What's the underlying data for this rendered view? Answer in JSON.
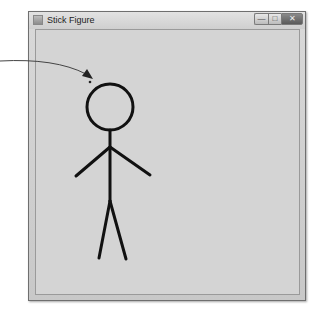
{
  "window": {
    "title": "Stick Figure",
    "app_icon": "java-app-icon",
    "controls": {
      "minimize": "—",
      "maximize": "□",
      "close": "✕"
    },
    "client_background": "#d4d4d4"
  },
  "figure": {
    "stroke_color": "#111111",
    "head": {
      "cx": 110,
      "cy": 107,
      "r": 23
    },
    "body": {
      "x1": 110,
      "y1": 130,
      "x2": 110,
      "y2": 201
    },
    "left_arm": {
      "x1": 110,
      "y1": 147,
      "x2": 76,
      "y2": 176
    },
    "right_arm": {
      "x1": 110,
      "y1": 147,
      "x2": 150,
      "y2": 175
    },
    "left_leg": {
      "x1": 110,
      "y1": 201,
      "x2": 99,
      "y2": 258
    },
    "right_leg": {
      "x1": 110,
      "y1": 201,
      "x2": 126,
      "y2": 259
    }
  },
  "annotation": {
    "arrow_color": "#333333",
    "pointer_dot": {
      "cx": 90,
      "cy": 82
    }
  }
}
